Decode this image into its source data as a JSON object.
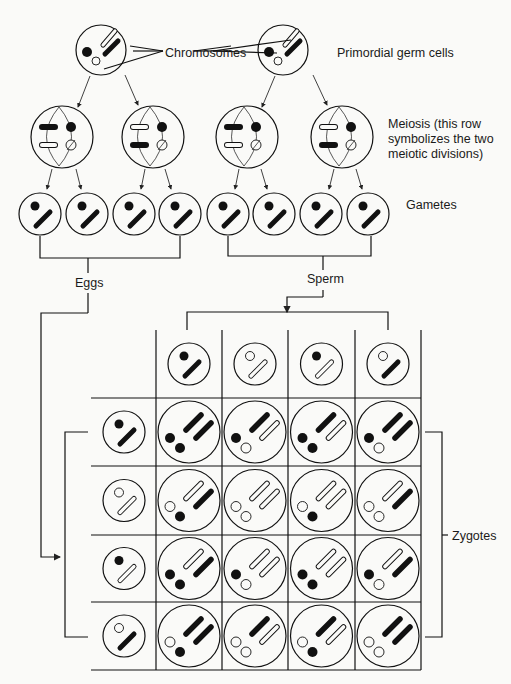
{
  "labels": {
    "chromosomes": "Chromosomes",
    "primordial": "Primordial germ cells",
    "meiosis_l1": "Meiosis (this row",
    "meiosis_l2": "symbolizes the two",
    "meiosis_l3": "meiotic divisions)",
    "gametes": "Gametes",
    "eggs": "Eggs",
    "sperm": "Sperm",
    "zygotes": "Zygotes"
  },
  "legend": {
    "filled": "paternal chromosome (black)",
    "hollow": "maternal chromosome (white)"
  },
  "gametes": [
    {
      "dot": "filled",
      "rod": "filled"
    },
    {
      "dot": "hollow",
      "rod": "hollow"
    },
    {
      "dot": "filled",
      "rod": "hollow"
    },
    {
      "dot": "hollow",
      "rod": "filled"
    }
  ],
  "punnett": {
    "sperm_columns": [
      "filled-dot/filled-rod",
      "hollow-dot/hollow-rod",
      "filled-dot/hollow-rod",
      "hollow-dot/filled-rod"
    ],
    "egg_rows": [
      "filled-dot/filled-rod",
      "hollow-dot/hollow-rod",
      "filled-dot/hollow-rod",
      "hollow-dot/filled-rod"
    ]
  }
}
